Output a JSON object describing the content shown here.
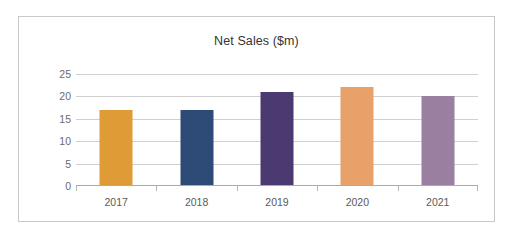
{
  "chart_data": {
    "type": "bar",
    "title": "Net Sales ($m)",
    "xlabel": "",
    "ylabel": "",
    "categories": [
      "2017",
      "2018",
      "2019",
      "2020",
      "2021"
    ],
    "values": [
      17,
      17,
      21,
      22,
      20
    ],
    "bar_colors": [
      "#df9b35",
      "#2e4a76",
      "#4b3a72",
      "#e8a169",
      "#9a7fa0"
    ],
    "ylim": [
      0,
      25
    ],
    "yticks": [
      0,
      5,
      10,
      15,
      20,
      25
    ],
    "ytick_labels": [
      "0",
      "5",
      "10",
      "15",
      "20",
      "25"
    ],
    "grid": true,
    "legend": false,
    "legend_position": "none"
  },
  "style": {
    "border_color": "#c9c9c9",
    "gridline_color": "#d0d0d0",
    "axis_color": "#aaaaaa",
    "title_color": "#333333",
    "tick_label_color": "#6b6b6b",
    "background": "#ffffff"
  }
}
